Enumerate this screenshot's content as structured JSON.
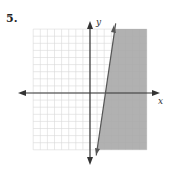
{
  "problem": {
    "number": "5."
  },
  "graph": {
    "x_label": "x",
    "y_label": "y",
    "grid_range": {
      "xmin": -8,
      "xmax": 8,
      "ymin": -8,
      "ymax": 9
    },
    "boundary_line": {
      "style": "solid",
      "point1": [
        1,
        -8
      ],
      "point2": [
        3.5,
        9
      ]
    },
    "shaded_side": "right",
    "shade_color": "#a8a8a8",
    "grid_color": "#d8d8d8",
    "axis_color": "#333333"
  }
}
